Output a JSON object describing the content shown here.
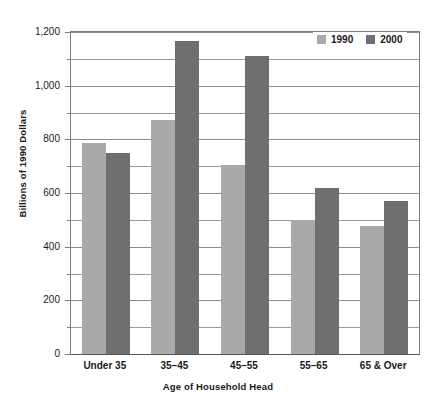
{
  "chart_data": {
    "type": "bar",
    "title": "",
    "subtitle": "",
    "xlabel": "Age of Household Head",
    "ylabel": "Billions of 1990 Dollars",
    "categories": [
      "Under 35",
      "35–45",
      "45–55",
      "55–65",
      "65 & Over"
    ],
    "series": [
      {
        "name": "1990",
        "color": "#a9a9a9",
        "values": [
          787,
          872,
          705,
          500,
          478
        ]
      },
      {
        "name": "2000",
        "color": "#6f6f6f",
        "values": [
          750,
          1165,
          1110,
          618,
          572
        ]
      }
    ],
    "ylim": [
      0,
      1200
    ],
    "y_major_ticks": [
      0,
      200,
      400,
      600,
      800,
      1000,
      1200
    ],
    "y_major_tick_labels": [
      "0",
      "200",
      "400",
      "600",
      "800",
      "1,000",
      "1,200"
    ],
    "y_minor_ticks": [
      100,
      300,
      500,
      700,
      900,
      1100
    ],
    "grid": "horizontal",
    "grid_color": "#8a8a8a",
    "legend_position": "top-right",
    "legend_entries": [
      "1990",
      "2000"
    ],
    "background_color": "#ffffff",
    "axis_color": "#7d7d7d",
    "text_color": "#1a1a1a"
  }
}
